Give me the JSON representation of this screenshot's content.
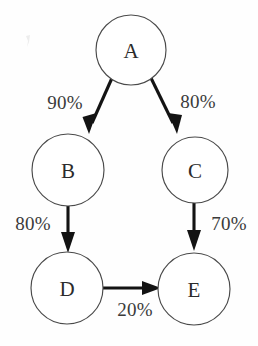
{
  "diagram": {
    "background_color": "#fefefe",
    "node_stroke_color": "#4a4a4a",
    "node_fill_color": "#ffffff",
    "edge_color": "#131313",
    "label_color": "#3a3a3a",
    "nodes": [
      {
        "id": "A",
        "label": "A",
        "cx": 131,
        "cy": 50,
        "r": 35
      },
      {
        "id": "B",
        "label": "B",
        "cx": 68,
        "cy": 170,
        "r": 36
      },
      {
        "id": "C",
        "label": "C",
        "cx": 195,
        "cy": 170,
        "r": 33
      },
      {
        "id": "D",
        "label": "D",
        "cx": 67,
        "cy": 288,
        "r": 36
      },
      {
        "id": "E",
        "label": "E",
        "cx": 194,
        "cy": 289,
        "r": 36
      }
    ],
    "edges": [
      {
        "id": "a-b",
        "from": "A",
        "to": "B",
        "label": "90%",
        "label_x": 65,
        "label_y": 102
      },
      {
        "id": "a-c",
        "from": "A",
        "to": "C",
        "label": "80%",
        "label_x": 198,
        "label_y": 101
      },
      {
        "id": "b-d",
        "from": "B",
        "to": "D",
        "label": "80%",
        "label_x": 33,
        "label_y": 223
      },
      {
        "id": "c-e",
        "from": "C",
        "to": "E",
        "label": "70%",
        "label_x": 229,
        "label_y": 223
      },
      {
        "id": "d-e",
        "from": "D",
        "to": "E",
        "label": "20%",
        "label_x": 135,
        "label_y": 309
      }
    ]
  }
}
